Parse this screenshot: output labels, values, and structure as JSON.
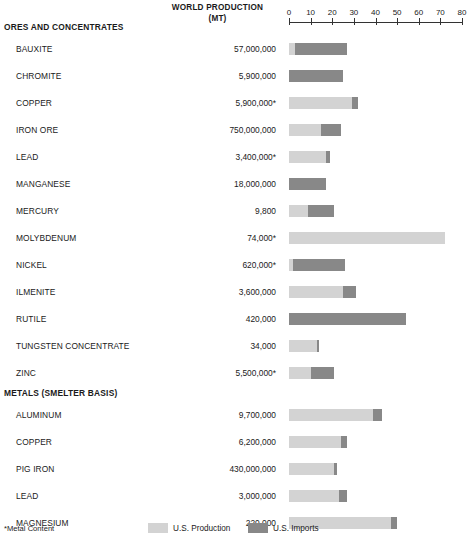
{
  "header": {
    "value_column_title_line1": "WORLD PRODUCTION",
    "value_column_title_line2": "(MT)"
  },
  "footnote": "*Metal Content",
  "legend": {
    "production": {
      "label": "U.S. Production",
      "color": "#d3d3d3"
    },
    "imports": {
      "label": "U.S. Imports",
      "color": "#888888"
    }
  },
  "sections": [
    {
      "title": "ORES AND CONCENTRATES"
    },
    {
      "title": "METALS (SMELTER BASIS)"
    }
  ],
  "chart_data": {
    "type": "bar",
    "title": "",
    "subtitle": "",
    "xlabel": "",
    "ylabel": "",
    "xlim": [
      0,
      80
    ],
    "xticks": [
      0,
      10,
      20,
      30,
      40,
      50,
      60,
      70,
      80
    ],
    "grid": false,
    "orientation": "horizontal",
    "stacked": true,
    "legend_position": "bottom",
    "series": [
      {
        "name": "U.S. Production",
        "color": "#d3d3d3"
      },
      {
        "name": "U.S. Imports",
        "color": "#888888"
      }
    ],
    "value_column_header": "WORLD PRODUCTION (MT)",
    "groups": [
      {
        "name": "ORES AND CONCENTRATES",
        "rows": [
          {
            "label": "BAUXITE",
            "value": "57,000,000",
            "production": 3,
            "imports": 24
          },
          {
            "label": "CHROMITE",
            "value": "5,900,000",
            "production": 0,
            "imports": 25
          },
          {
            "label": "COPPER",
            "value": "5,900,000*",
            "production": 29,
            "imports": 3
          },
          {
            "label": "IRON ORE",
            "value": "750,000,000",
            "production": 15,
            "imports": 9
          },
          {
            "label": "LEAD",
            "value": "3,400,000*",
            "production": 17,
            "imports": 2
          },
          {
            "label": "MANGANESE",
            "value": "18,000,000",
            "production": 0,
            "imports": 17
          },
          {
            "label": "MERCURY",
            "value": "9,800",
            "production": 9,
            "imports": 12
          },
          {
            "label": "MOLYBDENUM",
            "value": "74,000*",
            "production": 72,
            "imports": 0
          },
          {
            "label": "NICKEL",
            "value": "620,000*",
            "production": 2,
            "imports": 24
          },
          {
            "label": "ILMENITE",
            "value": "3,600,000",
            "production": 25,
            "imports": 6
          },
          {
            "label": "RUTILE",
            "value": "420,000",
            "production": 0,
            "imports": 54
          },
          {
            "label": "TUNGSTEN CONCENTRATE",
            "value": "34,000",
            "production": 13,
            "imports": 1
          },
          {
            "label": "ZINC",
            "value": "5,500,000*",
            "production": 10,
            "imports": 11
          }
        ]
      },
      {
        "name": "METALS (SMELTER BASIS)",
        "rows": [
          {
            "label": "ALUMINUM",
            "value": "9,700,000",
            "production": 39,
            "imports": 4
          },
          {
            "label": "COPPER",
            "value": "6,200,000",
            "production": 24,
            "imports": 3
          },
          {
            "label": "PIG IRON",
            "value": "430,000,000",
            "production": 21,
            "imports": 1
          },
          {
            "label": "LEAD",
            "value": "3,000,000",
            "production": 23,
            "imports": 4
          },
          {
            "label": "MAGNESIUM",
            "value": "220,000",
            "production": 47,
            "imports": 3
          },
          {
            "label": "STEEL (INGOTS AND CASTINGS)",
            "value": "590,000,000",
            "production": 23,
            "imports": 3
          },
          {
            "label": "TIN",
            "value": "220,000",
            "production": 0,
            "imports": 27
          },
          {
            "label": "URANIUM OXIDE",
            "value": "22,000",
            "production": 53,
            "imports": 3
          },
          {
            "label": "ZINC",
            "value": "4,900,000",
            "production": 15,
            "imports": 10
          }
        ]
      }
    ]
  }
}
